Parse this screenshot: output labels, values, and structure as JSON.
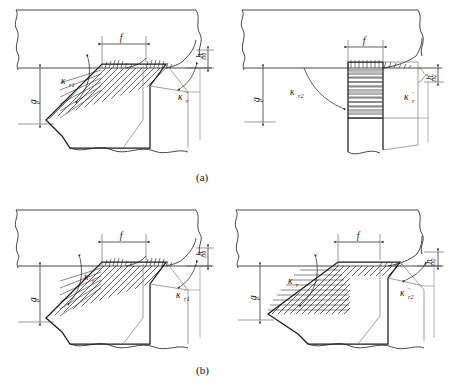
{
  "figure": {
    "title_visible": false,
    "panels": [
      {
        "id": "panel-a-left",
        "caption_group": "(a)",
        "labels": {
          "depth_of_cut": "a",
          "depth_of_cut_sub": "p",
          "feed": "f",
          "chip_thickness": "h",
          "chip_thickness_sub": "D1",
          "entering_angle": "κ",
          "entering_angle_sub": "r1",
          "minor_entering_angle": "κ",
          "minor_entering_angle_prime": "′",
          "minor_entering_angle_sub": "r"
        }
      },
      {
        "id": "panel-a-right",
        "caption_group": "(a)",
        "labels": {
          "depth_of_cut": "a",
          "depth_of_cut_sub": "p",
          "feed": "f",
          "chip_thickness": "h",
          "chip_thickness_sub": "D2",
          "entering_angle": "κ",
          "entering_angle_sub": "r2",
          "minor_entering_angle": "κ",
          "minor_entering_angle_prime": "′",
          "minor_entering_angle_sub": "r"
        }
      },
      {
        "id": "panel-b-left",
        "caption_group": "(b)",
        "labels": {
          "depth_of_cut": "a",
          "depth_of_cut_sub": "p",
          "feed": "f",
          "chip_thickness": "h",
          "chip_thickness_sub": "D1",
          "entering_angle": "κ",
          "entering_angle_sub": "r",
          "minor_entering_angle": "κ",
          "minor_entering_angle_prime": "′",
          "minor_entering_angle_sub": "r1"
        }
      },
      {
        "id": "panel-b-right",
        "caption_group": "(b)",
        "labels": {
          "depth_of_cut": "a",
          "depth_of_cut_sub": "p",
          "feed": "f",
          "chip_thickness": "h",
          "chip_thickness_sub": "D2",
          "entering_angle": "κ",
          "entering_angle_sub": "r",
          "minor_entering_angle": "κ",
          "minor_entering_angle_prime": "′",
          "minor_entering_angle_sub": "r2"
        }
      }
    ],
    "captions": {
      "a": "(a)",
      "b": "(b)"
    },
    "colors": {
      "line": "#1a1a1a",
      "thin_line": "#444444",
      "hatch": "#222222",
      "background": "#ffffff"
    }
  }
}
